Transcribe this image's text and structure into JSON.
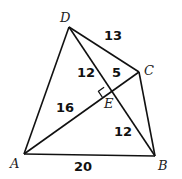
{
  "diagram": {
    "type": "geometry-quadrilateral",
    "vertices": {
      "A": {
        "label": "A",
        "x": 24,
        "y": 154
      },
      "B": {
        "label": "B",
        "x": 155,
        "y": 156
      },
      "C": {
        "label": "C",
        "x": 139,
        "y": 72
      },
      "D": {
        "label": "D",
        "x": 69,
        "y": 27
      },
      "E": {
        "label": "E",
        "x": 108,
        "y": 93
      }
    },
    "segment_labels": {
      "DC": "13",
      "DE": "12",
      "EC": "5",
      "AE": "16",
      "EB": "12",
      "AB": "20"
    },
    "right_angle_at": "E",
    "stroke_color": "#111111"
  }
}
